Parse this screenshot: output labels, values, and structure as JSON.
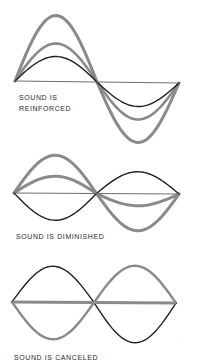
{
  "colors": {
    "black_wave": "#1e1e1e",
    "gray_wave": "#8a8a8a",
    "baseline": "#6e6e6e",
    "background": "#ffffff"
  },
  "panels": [
    {
      "id": "reinforced",
      "caption_lines": [
        "SOUND IS",
        "REINFORCED"
      ],
      "caption_pos": {
        "x": 19,
        "y": 92
      },
      "baseline": {
        "x0": 15,
        "x1": 179,
        "y": 81,
        "y1": 83,
        "width": 1.2,
        "color_key": "baseline"
      },
      "waves": [
        {
          "name": "component-wave-black",
          "color_key": "black_wave",
          "width": 1.4,
          "x0": 15,
          "x1": 179,
          "y0": 81,
          "amp_up": 25,
          "amp_down": 24,
          "phase": "sine"
        },
        {
          "name": "component-wave-gray",
          "color_key": "gray_wave",
          "width": 2.6,
          "x0": 15,
          "x1": 179,
          "y0": 81,
          "amp_up": 38,
          "amp_down": 37,
          "phase": "sine"
        },
        {
          "name": "resultant-wave-gray",
          "color_key": "gray_wave",
          "width": 3,
          "x0": 15,
          "x1": 179,
          "y0": 81,
          "amp_up": 66,
          "amp_down": 60,
          "phase": "sine"
        }
      ]
    },
    {
      "id": "diminished",
      "caption_lines": [
        "SOUND IS DIMINISHED"
      ],
      "caption_pos": {
        "x": 16,
        "y": 231
      },
      "baseline": {
        "x0": 14,
        "x1": 179,
        "y": 193,
        "y1": 194,
        "width": 1.2,
        "color_key": "baseline"
      },
      "waves": [
        {
          "name": "component-wave-black",
          "color_key": "black_wave",
          "width": 1.4,
          "x0": 14,
          "x1": 179,
          "y0": 193,
          "amp_up": -27,
          "amp_down": -22,
          "phase": "sine"
        },
        {
          "name": "component-wave-gray",
          "color_key": "gray_wave",
          "width": 3,
          "x0": 14,
          "x1": 179,
          "y0": 193,
          "amp_up": 38,
          "amp_down": 37,
          "phase": "sine"
        },
        {
          "name": "resultant-wave-gray",
          "color_key": "gray_wave",
          "width": 3,
          "x0": 14,
          "x1": 179,
          "y0": 193,
          "amp_up": 17,
          "amp_down": 12,
          "phase": "sine"
        }
      ]
    },
    {
      "id": "canceled",
      "caption_lines": [
        "SOUND IS CANCELED"
      ],
      "caption_pos": {
        "x": 14,
        "y": 352
      },
      "baseline": {
        "x0": 12,
        "x1": 176,
        "y": 302,
        "y1": 303,
        "width": 3.2,
        "color_key": "gray_wave"
      },
      "waves": [
        {
          "name": "component-wave-black",
          "color_key": "black_wave",
          "width": 1.4,
          "x0": 12,
          "x1": 176,
          "y0": 302,
          "amp_up": 36,
          "amp_down": 40,
          "phase": "sine"
        },
        {
          "name": "component-wave-gray",
          "color_key": "gray_wave",
          "width": 2.4,
          "x0": 12,
          "x1": 176,
          "y0": 302,
          "amp_up": -37,
          "amp_down": -37,
          "phase": "sine"
        }
      ]
    }
  ]
}
